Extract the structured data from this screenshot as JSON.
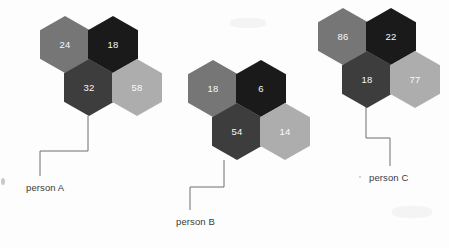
{
  "canvas": {
    "width": 449,
    "height": 248,
    "background": "#fdfdfd"
  },
  "palette": {
    "very_dark": "#1a1a1a",
    "dark_gray": "#3d3d3d",
    "medium_gray": "#767676",
    "light_gray": "#adadad",
    "leader_line": "#6e6e6e",
    "label_text": "#3b3b3b",
    "value_text": "#ffffff"
  },
  "chart_data": {
    "type": "diagram",
    "subtype": "hexagon-cluster-callout",
    "title": "",
    "clusters": [
      {
        "label": "person A",
        "label_x": 26,
        "label_y": 182,
        "leader": {
          "start_x": 88,
          "start_y": 116,
          "corner_y": 151,
          "corner_x": 40,
          "end_y": 176
        },
        "cells": [
          {
            "value": "24",
            "tone": "medium_gray",
            "color": "#767676",
            "x": 40,
            "y": 16,
            "col": "left",
            "row": "top"
          },
          {
            "value": "18",
            "tone": "very_dark",
            "color": "#1a1a1a",
            "x": 88,
            "y": 16,
            "col": "right",
            "row": "top"
          },
          {
            "value": "32",
            "tone": "dark_gray",
            "color": "#3d3d3d",
            "x": 64,
            "y": 59,
            "col": "mid",
            "row": "bottom"
          },
          {
            "value": "58",
            "tone": "light_gray",
            "color": "#adadad",
            "x": 112,
            "y": 59,
            "col": "far",
            "row": "bottom"
          }
        ]
      },
      {
        "label": "person B",
        "label_x": 176,
        "label_y": 216,
        "leader": {
          "start_x": 224,
          "start_y": 160,
          "corner_y": 187,
          "corner_x": 190,
          "end_y": 210
        },
        "cells": [
          {
            "value": "18",
            "tone": "medium_gray",
            "color": "#767676",
            "x": 188,
            "y": 60,
            "col": "left",
            "row": "top"
          },
          {
            "value": "6",
            "tone": "very_dark",
            "color": "#1a1a1a",
            "x": 236,
            "y": 60,
            "col": "right",
            "row": "top"
          },
          {
            "value": "54",
            "tone": "dark_gray",
            "color": "#3d3d3d",
            "x": 212,
            "y": 103,
            "col": "mid",
            "row": "bottom"
          },
          {
            "value": "14",
            "tone": "light_gray",
            "color": "#adadad",
            "x": 260,
            "y": 103,
            "col": "far",
            "row": "bottom"
          }
        ]
      },
      {
        "label": "person C",
        "label_x": 369,
        "label_y": 172,
        "leader": {
          "start_x": 366,
          "start_y": 103,
          "corner_y": 138,
          "corner_x": 390,
          "end_y": 166
        },
        "cells": [
          {
            "value": "86",
            "tone": "medium_gray",
            "color": "#767676",
            "x": 318,
            "y": 8,
            "col": "left",
            "row": "top"
          },
          {
            "value": "22",
            "tone": "very_dark",
            "color": "#1a1a1a",
            "x": 366,
            "y": 8,
            "col": "right",
            "row": "top"
          },
          {
            "value": "18",
            "tone": "dark_gray",
            "color": "#3d3d3d",
            "x": 342,
            "y": 51,
            "col": "mid",
            "row": "bottom"
          },
          {
            "value": "77",
            "tone": "light_gray",
            "color": "#adadad",
            "x": 390,
            "y": 51,
            "col": "far",
            "row": "bottom"
          }
        ]
      }
    ]
  }
}
